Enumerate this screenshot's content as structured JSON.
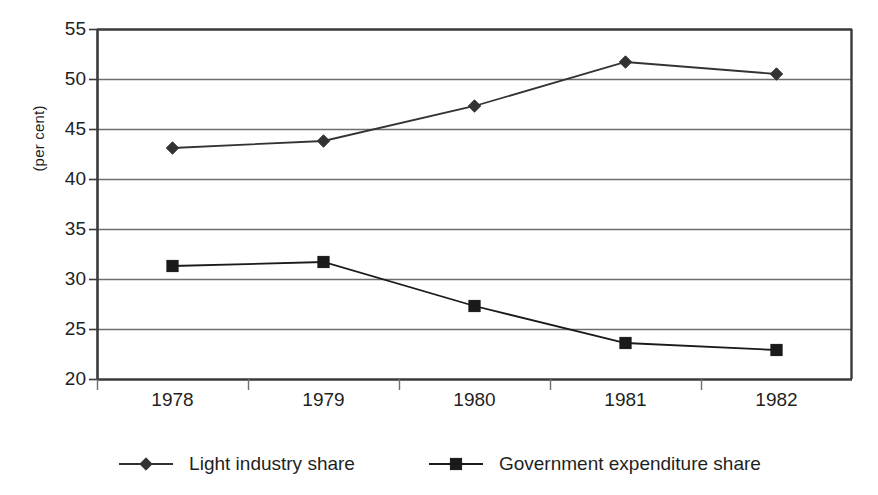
{
  "chart_data": {
    "type": "line",
    "title": "",
    "subtitle": "",
    "xlabel": "",
    "ylabel": "(per cent)",
    "categories": [
      "1978",
      "1979",
      "1980",
      "1981",
      "1982"
    ],
    "x": [
      1978,
      1979,
      1980,
      1981,
      1982
    ],
    "series": [
      {
        "name": "Light industry share",
        "marker": "diamond",
        "color": "#333333",
        "values": [
          43.1,
          43.8,
          47.3,
          51.7,
          50.5
        ]
      },
      {
        "name": "Government expenditure share",
        "marker": "square",
        "color": "#1a1a1a",
        "values": [
          31.3,
          31.7,
          27.3,
          23.6,
          22.9
        ]
      }
    ],
    "ylim": [
      20,
      55
    ],
    "yticks": [
      20,
      25,
      30,
      35,
      40,
      45,
      50,
      55
    ],
    "ytick_labels": [
      "20",
      "25",
      "30",
      "35",
      "40",
      "45",
      "50",
      "55"
    ],
    "grid": "horizontal",
    "legend_position": "bottom",
    "plot_background": "#ffffff",
    "axis_color": "#404040",
    "grid_color": "#6e6e6e"
  },
  "axes": {
    "y_title": "(per cent)"
  },
  "legend": {
    "items": [
      {
        "label": "Light industry share",
        "marker": "diamond-marker"
      },
      {
        "label": "Government expenditure share",
        "marker": "square-marker"
      }
    ]
  }
}
